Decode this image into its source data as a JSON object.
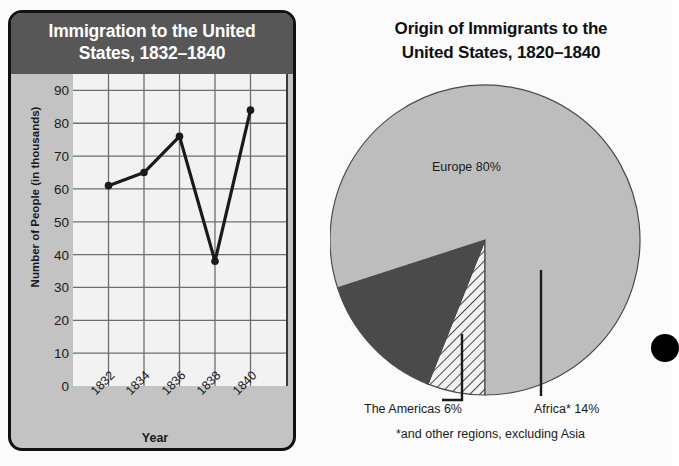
{
  "line_panel": {
    "title_line1": "Immigration to the United",
    "title_line2": "States, 1832–1840",
    "y_axis_title": "Number of People (in thousands)",
    "x_axis_title": "Year",
    "header_bg": "#575757",
    "panel_bg": "#c3c3c3",
    "plot_bg": "#f2f2f2",
    "line_color": "#1a1a1a"
  },
  "pie_panel": {
    "title_line1": "Origin of Immigrants to the",
    "title_line2": "United States, 1820–1840",
    "footnote": "*and other regions, excluding Asia",
    "europe_label": "Europe 80%",
    "americas_label": "The Americas 6%",
    "africa_label": "Africa* 14%",
    "europe_color": "#bdbdbd",
    "africa_color": "#4a4a4a",
    "americas_color": "#f2f2f2"
  },
  "chart_data": [
    {
      "type": "line",
      "title": "Immigration to the United States, 1832–1840",
      "xlabel": "Year",
      "ylabel": "Number of People (in thousands)",
      "categories": [
        "1832",
        "1834",
        "1836",
        "1838",
        "1840"
      ],
      "values": [
        61,
        65,
        76,
        38,
        84
      ],
      "ylim": [
        0,
        95
      ],
      "yticks": [
        0,
        10,
        20,
        30,
        40,
        50,
        60,
        70,
        80,
        90
      ],
      "ytick_labels": [
        "0",
        "10",
        "20",
        "30",
        "40",
        "50",
        "60",
        "70",
        "80",
        "90"
      ],
      "grid": true,
      "legend": "none",
      "marker": "circle"
    },
    {
      "type": "pie",
      "title": "Origin of Immigrants to the United States, 1820–1840",
      "labels": [
        "Europe 80%",
        "Africa* 14%",
        "The Americas 6%"
      ],
      "slice_names": [
        "Europe",
        "Africa*",
        "The Americas"
      ],
      "values": [
        80,
        14,
        6
      ],
      "colors": [
        "#bdbdbd",
        "#4a4a4a",
        "#f2f2f2"
      ],
      "patterns": [
        "solid",
        "solid",
        "diagonal-hatch"
      ],
      "annotation": "*and other regions, excluding Asia",
      "legend": "labels-on-slices-and-leader-lines"
    }
  ]
}
